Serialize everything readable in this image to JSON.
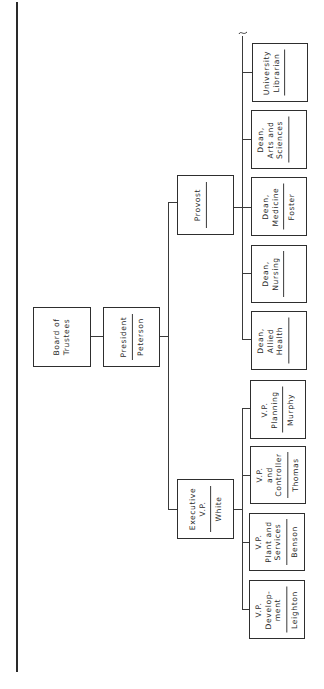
{
  "chart_title": "",
  "nodes": {
    "board": {
      "title": "Board of\nTrustees",
      "name": null
    },
    "president": {
      "title": "President",
      "name": "Peterson"
    },
    "provost": {
      "title": "Provost",
      "name": ""
    },
    "exec_vp": {
      "title": "Executive\nV.P.",
      "name": "White"
    },
    "librarian": {
      "title": "University\nLibrarian",
      "name": ""
    },
    "dean_arts": {
      "title": "Dean,\nArts and\nSciences",
      "name": ""
    },
    "dean_med": {
      "title": "Dean,\nMedicine",
      "name": "Foster"
    },
    "dean_nurs": {
      "title": "Dean,\nNursing",
      "name": ""
    },
    "dean_allied": {
      "title": "Dean,\nAllied\nHealth",
      "name": ""
    },
    "vp_plan": {
      "title": "V.P.\nPlanning",
      "name": "Murphy"
    },
    "vp_ctrl": {
      "title": "V.P.\nand\nController",
      "name": "Thomas"
    },
    "vp_plant": {
      "title": "V.P.\nPlant and\nServices",
      "name": "Benson"
    },
    "vp_dev": {
      "title": "V.P.\nDevelop-\nment",
      "name": "Leighton"
    }
  },
  "hierarchy": {
    "Board of Trustees": [
      "President"
    ],
    "President": [
      "Provost",
      "Executive V.P."
    ],
    "Provost": [
      "University Librarian",
      "Dean, Arts and Sciences",
      "Dean, Medicine",
      "Dean, Nursing",
      "Dean, Allied Health"
    ],
    "Executive V.P.": [
      "V.P. Planning",
      "V.P. and Controller",
      "V.P. Plant and Services",
      "V.P. Development"
    ]
  }
}
